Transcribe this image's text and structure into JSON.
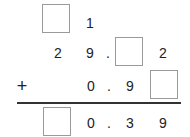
{
  "problem": {
    "operation": "+",
    "rows": [
      {
        "cells": [
          "[ ]",
          "1"
        ]
      },
      {
        "cells": [
          "2",
          "9",
          ".",
          "[ ]",
          "2"
        ]
      },
      {
        "cells": [
          "+",
          "0",
          ".",
          "9",
          "[ ]"
        ]
      },
      {
        "cells": [
          "[ ]",
          "0",
          ".",
          "3",
          "9"
        ]
      }
    ],
    "row1": {
      "d2": "1"
    },
    "row2": {
      "d1": "2",
      "d2": "9",
      "dot": ".",
      "d4": "2"
    },
    "row3": {
      "sign": "+",
      "d2": "0",
      "dot": ".",
      "d3": "9"
    },
    "row4": {
      "d2": "0",
      "dot": ".",
      "d3": "3",
      "d4": "9"
    }
  },
  "colors": {
    "text": "#222222",
    "box_border": "#9a9a9a",
    "rule": "#333333"
  }
}
